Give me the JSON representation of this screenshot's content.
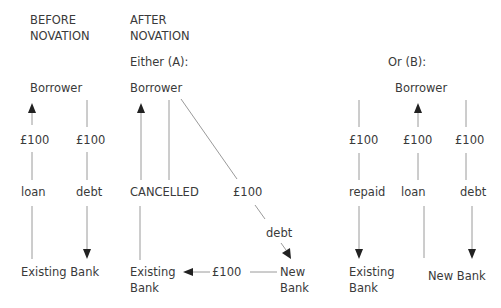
{
  "headers": {
    "before_line1": "BEFORE",
    "before_line2": "NOVATION",
    "after_line1": "AFTER",
    "after_line2": "NOVATION",
    "option_a": "Either (A):",
    "option_b": "Or (B):"
  },
  "before": {
    "borrower": "Borrower",
    "loan_amount": "£100",
    "debt_amount": "£100",
    "loan_label": "loan",
    "debt_label": "debt",
    "bank": "Existing Bank"
  },
  "option_a": {
    "borrower": "Borrower",
    "cancelled": "CANCELLED",
    "debt_amount": "£100",
    "debt_label": "debt",
    "bank_line1": "Existing",
    "bank_line2": "Bank",
    "transfer_amount": "£100",
    "new_bank_line1": "New",
    "new_bank_line2": "Bank"
  },
  "option_b": {
    "borrower": "Borrower",
    "repaid_amount": "£100",
    "loan_amount": "£100",
    "debt_amount": "£100",
    "repaid_label": "repaid",
    "loan_label": "loan",
    "debt_label": "debt",
    "existing_bank_line1": "Existing",
    "existing_bank_line2": "Bank",
    "new_bank": "New Bank"
  },
  "colors": {
    "text": "#3a3a3a",
    "line": "#9a9a9a",
    "arrowhead": "#222222"
  }
}
